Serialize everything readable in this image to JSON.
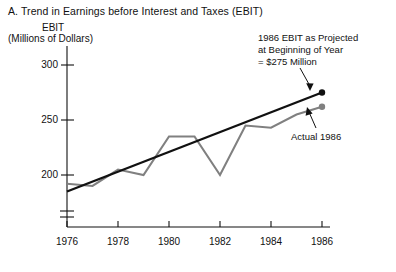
{
  "panel": {
    "title": "A. Trend in Earnings before Interest and Taxes (EBIT)"
  },
  "axes": {
    "y_label_line1": "EBIT",
    "y_label_line2": "(Millions of Dollars)",
    "y_ticks": [
      "300",
      "250",
      "200"
    ],
    "x_ticks": [
      "1976",
      "1978",
      "1980",
      "1982",
      "1984",
      "1986"
    ],
    "axis_break": "broken-axis-symbol"
  },
  "annotations": {
    "projected_line1": "1986 EBIT as Projected",
    "projected_line2": "at Beginning of Year",
    "projected_line3": "= $275 Million",
    "actual_label": "Actual 1986"
  },
  "colors": {
    "actual_series": "#808080",
    "trend_line": "#111111",
    "axis": "#111111",
    "background": "#ffffff"
  },
  "chart_data": {
    "type": "line",
    "title": "A. Trend in Earnings before Interest and Taxes (EBIT)",
    "xlabel": "",
    "ylabel": "EBIT (Millions of Dollars)",
    "ylim": [
      185,
      310
    ],
    "xlim": [
      1976,
      1986
    ],
    "ytick_values": [
      300,
      250,
      200
    ],
    "xtick_values": [
      1976,
      1978,
      1980,
      1982,
      1984,
      1986
    ],
    "grid": false,
    "legend": "none",
    "axis_broken_below": true,
    "x": [
      1976,
      1977,
      1978,
      1979,
      1980,
      1981,
      1982,
      1983,
      1984,
      1985,
      1986
    ],
    "series": [
      {
        "name": "Actual EBIT",
        "color": "#808080",
        "values": [
          192,
          190,
          205,
          200,
          235,
          235,
          200,
          245,
          243,
          255,
          262
        ]
      },
      {
        "name": "Trend line (projection)",
        "color": "#111111",
        "values": [
          185,
          194,
          203,
          212,
          221,
          230,
          239,
          248,
          257,
          266,
          275
        ]
      }
    ],
    "annotations": [
      {
        "text": "1986 EBIT as Projected at Beginning of Year = $275 Million",
        "points_to": {
          "x": 1986,
          "y": 275
        }
      },
      {
        "text": "Actual 1986",
        "points_to": {
          "x": 1986,
          "y": 262
        }
      }
    ]
  }
}
